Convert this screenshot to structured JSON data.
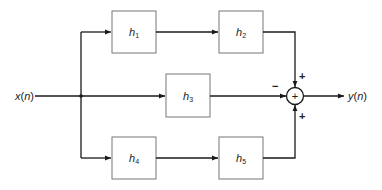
{
  "diagram": {
    "input": {
      "label": "x(n)",
      "var": "x",
      "arg": "n"
    },
    "output": {
      "label": "y(n)",
      "var": "y",
      "arg": "n"
    },
    "blocks": [
      {
        "id": "h1",
        "base": "h",
        "sub": "1"
      },
      {
        "id": "h2",
        "base": "h",
        "sub": "2"
      },
      {
        "id": "h3",
        "base": "h",
        "sub": "3"
      },
      {
        "id": "h4",
        "base": "h",
        "sub": "4"
      },
      {
        "id": "h5",
        "base": "h",
        "sub": "5"
      }
    ],
    "summer": {
      "symbol": "+",
      "signs": {
        "top": "+",
        "left": "−",
        "bottom": "+"
      }
    },
    "colors": {
      "line": "#1a1a1a",
      "box_stroke": "#777777",
      "background": "#ffffff"
    }
  }
}
